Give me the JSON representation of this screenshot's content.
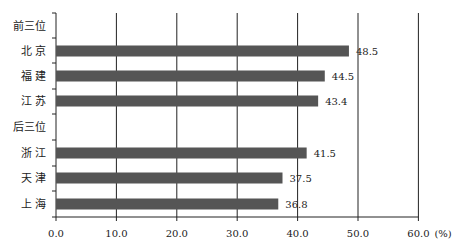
{
  "chart_data": {
    "type": "bar",
    "orientation": "horizontal",
    "title": "",
    "xlabel": "",
    "ylabel": "",
    "unit_label": "(%)",
    "xlim": [
      0,
      60
    ],
    "x_ticks": [
      "0.0",
      "10.0",
      "20.0",
      "30.0",
      "40.0",
      "50.0",
      "60.0"
    ],
    "grid": "vertical",
    "categories": [
      "前三位",
      "北 京",
      "福 建",
      "江 苏",
      "后三位",
      "浙 江",
      "天 津",
      "上 海"
    ],
    "values": [
      null,
      48.5,
      44.5,
      43.4,
      null,
      41.5,
      37.5,
      36.8
    ],
    "value_labels": [
      "",
      "48.5",
      "44.5",
      "43.4",
      "",
      "41.5",
      "37.5",
      "36.8"
    ],
    "groups": [
      {
        "name": "前三位",
        "items": [
          {
            "label": "北 京",
            "value": 48.5
          },
          {
            "label": "福 建",
            "value": 44.5
          },
          {
            "label": "江 苏",
            "value": 43.4
          }
        ]
      },
      {
        "name": "后三位",
        "items": [
          {
            "label": "浙 江",
            "value": 41.5
          },
          {
            "label": "天 津",
            "value": 37.5
          },
          {
            "label": "上 海",
            "value": 36.8
          }
        ]
      }
    ],
    "bar_color": "#555555",
    "legend": null
  }
}
